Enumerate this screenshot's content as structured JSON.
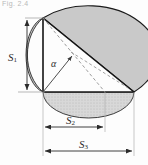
{
  "figure": {
    "caption_fragment": "Fig. 2.4",
    "labels": {
      "s1": "S",
      "s1_sub": "1",
      "s2": "S",
      "s2_sub": "2",
      "s3": "S",
      "s3_sub": "3",
      "alpha": "α"
    },
    "icon_names": {
      "vertical_dimension": "dimension-arrow-vertical-icon",
      "middle_dimension": "dimension-arrow-horizontal-icon",
      "full_dimension": "dimension-arrow-horizontal-icon",
      "angle_marker": "angle-arrow-icon"
    },
    "colors": {
      "outline": "#1a1a1a",
      "crescent_fill": "#c9c9c9",
      "ellipse_fill": "#d6d6d6",
      "base_fill": "#bdbdbd",
      "dimension_line": "#3a3a3a",
      "dashed_line": "#7a7a7a",
      "background": "#fdfdfd",
      "caption_text": "#b9b9b9"
    },
    "geometry": {
      "apex": [
        43,
        18
      ],
      "base_left": [
        43,
        92
      ],
      "base_right": [
        134,
        92
      ],
      "mid_marker_x": 105,
      "left_dim_x": 27,
      "mid_dim_y": 127,
      "full_dim_y": 151
    }
  }
}
